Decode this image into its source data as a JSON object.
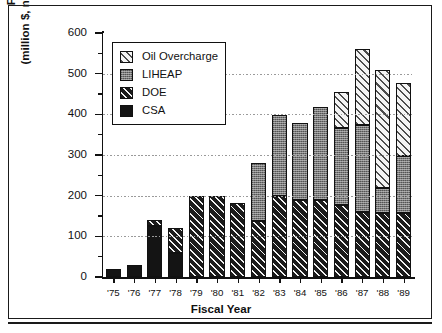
{
  "chart_data": {
    "type": "bar",
    "stacked": true,
    "title": "",
    "xlabel": "Fiscal Year",
    "ylabel": "Funding Level (million $, not adjusted for inflation)",
    "ylabel_line1": "Funding Level",
    "ylabel_line2": "(million $, not adjusted for inflation)",
    "categories": [
      "'75",
      "'76",
      "'77",
      "'78",
      "'79",
      "'80",
      "'81",
      "'82",
      "'83",
      "'84",
      "'85",
      "'86",
      "'87",
      "'88",
      "'89"
    ],
    "ylim": [
      0,
      600
    ],
    "yticks": [
      0,
      100,
      200,
      300,
      400,
      500,
      600
    ],
    "ytick_labels": [
      "0",
      "100",
      "200",
      "300",
      "400",
      "500",
      "600"
    ],
    "yminor_step": 50,
    "grid": "horizontal-dotted",
    "legend_position": "top-left-inside",
    "series": [
      {
        "name": "CSA",
        "swatch": "sw-csa",
        "values": [
          20,
          30,
          125,
          60,
          0,
          0,
          0,
          0,
          0,
          0,
          0,
          0,
          0,
          0,
          0
        ]
      },
      {
        "name": "DOE",
        "swatch": "sw-doe",
        "values": [
          0,
          0,
          15,
          60,
          200,
          200,
          182,
          138,
          198,
          190,
          190,
          178,
          160,
          158,
          158
        ]
      },
      {
        "name": "LIHEAP",
        "swatch": "sw-liheap",
        "values": [
          0,
          0,
          0,
          0,
          0,
          0,
          0,
          142,
          200,
          188,
          228,
          188,
          215,
          60,
          140
        ]
      },
      {
        "name": "Oil Overcharge",
        "swatch": "sw-oil",
        "values": [
          0,
          0,
          0,
          0,
          0,
          0,
          0,
          0,
          0,
          0,
          0,
          90,
          185,
          290,
          180
        ]
      }
    ],
    "totals": [
      20,
      30,
      140,
      120,
      200,
      200,
      182,
      280,
      398,
      378,
      418,
      456,
      560,
      508,
      478
    ],
    "legend": [
      {
        "label": "Oil Overcharge",
        "swatch": "sw-oil"
      },
      {
        "label": "LIHEAP",
        "swatch": "sw-liheap"
      },
      {
        "label": "DOE",
        "swatch": "sw-doe"
      },
      {
        "label": "CSA",
        "swatch": "sw-csa"
      }
    ],
    "colors": {
      "csa": "#141414",
      "doe": "#1b1b1b",
      "liheap": "#787878",
      "oil_overcharge": "#f4f4f4",
      "axis": "#111111",
      "grid": "#9a9a9a",
      "background": "#ffffff"
    }
  }
}
